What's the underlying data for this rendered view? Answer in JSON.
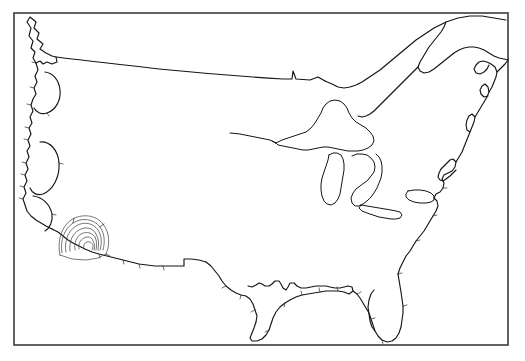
{
  "figure": {
    "background_color": "#ffffff",
    "frame_color": "#3b3b3b",
    "coastline_color": "#151515",
    "contour_color": "#4a4a4a",
    "width_px": 525,
    "height_px": 361
  },
  "frame": {
    "x": 14,
    "y": 13,
    "width": 494,
    "height": 332,
    "stroke_width": 1.6
  },
  "map": {
    "region_name": "Contiguous United States",
    "features": [
      {
        "name": "pacific-northwest-coast",
        "label": "Pacific Northwest Coast"
      },
      {
        "name": "vancouver-island",
        "label": "Vancouver Island"
      },
      {
        "name": "california-coast",
        "label": "California Coast"
      },
      {
        "name": "baja-california",
        "label": "Baja California"
      },
      {
        "name": "northern-border",
        "label": "49th Parallel Border"
      },
      {
        "name": "great-lakes",
        "label": "Great Lakes"
      },
      {
        "name": "saint-lawrence",
        "label": "St. Lawrence Seaway"
      },
      {
        "name": "new-england-coast",
        "label": "New England Coast"
      },
      {
        "name": "atlantic-coast",
        "label": "Atlantic Coast"
      },
      {
        "name": "florida-peninsula",
        "label": "Florida Peninsula"
      },
      {
        "name": "gulf-coast",
        "label": "Gulf of Mexico Coast"
      },
      {
        "name": "rio-grande-border",
        "label": "Rio Grande Border"
      },
      {
        "name": "southwest-border",
        "label": "Southwest Border"
      }
    ],
    "lakes": [
      {
        "name": "lake-superior",
        "label": "Lake Superior"
      },
      {
        "name": "lake-michigan",
        "label": "Lake Michigan"
      },
      {
        "name": "lake-huron",
        "label": "Lake Huron"
      },
      {
        "name": "lake-erie",
        "label": "Lake Erie"
      },
      {
        "name": "lake-ontario",
        "label": "Lake Ontario"
      }
    ]
  },
  "contours": {
    "name": "southern-california-contours",
    "label": "Concentric contour rings",
    "location": "Southern California / San Diego",
    "ring_count": 6,
    "center_x": 84,
    "center_y": 247,
    "stroke_color": "#4a4a4a"
  },
  "chart_data": {
    "type": "map",
    "projection_hint": "conic",
    "xlabel": "",
    "ylabel": "",
    "grid": false,
    "legend": "none",
    "annotations": [
      {
        "name": "contour-cluster",
        "description": "Nested concentric contour arcs over Southern California",
        "x": 84,
        "y": 247,
        "levels": 6
      }
    ]
  }
}
